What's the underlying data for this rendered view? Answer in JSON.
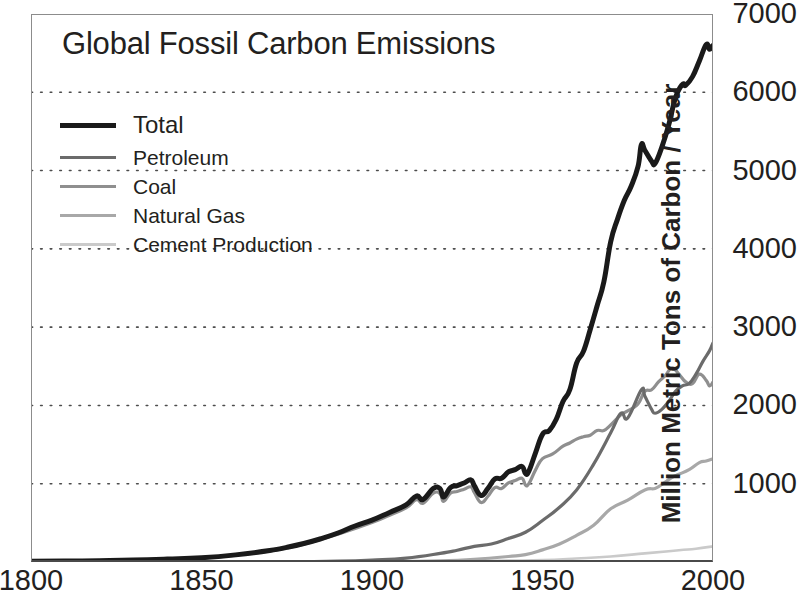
{
  "chart_data": {
    "type": "line",
    "title": "Global Fossil Carbon Emissions",
    "xlabel": "",
    "ylabel": "Million Metric Tons of Carbon / Year",
    "xlim": [
      1800,
      2000
    ],
    "ylim": [
      0,
      7000
    ],
    "xticks": [
      1800,
      1850,
      1900,
      1950,
      2000
    ],
    "xtick_labels": [
      "1800",
      "1850",
      "1900",
      "1950",
      "2000"
    ],
    "yticks": [
      0,
      1000,
      2000,
      3000,
      4000,
      5000,
      6000,
      7000
    ],
    "ytick_labels": [
      "0",
      "1000",
      "2000",
      "3000",
      "4000",
      "5000",
      "6000",
      "7000"
    ],
    "ytick_labels_shown": [
      "1000",
      "2000",
      "3000",
      "4000",
      "5000",
      "6000",
      "7000"
    ],
    "grid": "horizontal-dotted",
    "y_axis_position": "right",
    "legend_position": "upper-left-inside",
    "series": [
      {
        "name": "Total",
        "color": "#1a1a1a",
        "width": 5,
        "x": [
          1800,
          1810,
          1820,
          1830,
          1840,
          1850,
          1860,
          1870,
          1875,
          1880,
          1885,
          1890,
          1895,
          1900,
          1905,
          1910,
          1913,
          1915,
          1918,
          1920,
          1921,
          1923,
          1925,
          1927,
          1929,
          1930,
          1932,
          1934,
          1936,
          1938,
          1940,
          1942,
          1944,
          1945,
          1946,
          1948,
          1950,
          1952,
          1954,
          1956,
          1958,
          1960,
          1962,
          1964,
          1966,
          1968,
          1970,
          1972,
          1974,
          1976,
          1978,
          1979,
          1980,
          1982,
          1983,
          1985,
          1987,
          1989,
          1991,
          1992,
          1994,
          1996,
          1998,
          1999,
          2000
        ],
        "y": [
          8,
          12,
          17,
          24,
          37,
          54,
          91,
          147,
          187,
          236,
          297,
          370,
          460,
          534,
          630,
          730,
          843,
          800,
          940,
          935,
          830,
          950,
          975,
          1010,
          1050,
          975,
          850,
          940,
          1060,
          1070,
          1150,
          1180,
          1220,
          1130,
          1160,
          1400,
          1630,
          1680,
          1820,
          2050,
          2200,
          2540,
          2690,
          2970,
          3270,
          3580,
          4090,
          4380,
          4620,
          4800,
          5050,
          5330,
          5260,
          5120,
          5090,
          5300,
          5580,
          5930,
          6100,
          6090,
          6200,
          6400,
          6610,
          6550,
          6600
        ]
      },
      {
        "name": "Petroleum",
        "color": "#6b6b6b",
        "width": 3.2,
        "x": [
          1870,
          1880,
          1890,
          1900,
          1910,
          1920,
          1925,
          1930,
          1935,
          1940,
          1945,
          1950,
          1955,
          1960,
          1965,
          1970,
          1973,
          1975,
          1979,
          1980,
          1982,
          1983,
          1985,
          1987,
          1989,
          1991,
          1993,
          1995,
          1997,
          1999,
          2000
        ],
        "y": [
          1,
          4,
          10,
          25,
          50,
          110,
          150,
          200,
          230,
          300,
          380,
          530,
          700,
          920,
          1250,
          1650,
          1900,
          1840,
          2200,
          2120,
          1950,
          1900,
          1950,
          2050,
          2180,
          2250,
          2280,
          2400,
          2560,
          2700,
          2800
        ]
      },
      {
        "name": "Coal",
        "color": "#8f8f8f",
        "width": 3.2,
        "x": [
          1800,
          1820,
          1840,
          1850,
          1860,
          1870,
          1880,
          1890,
          1900,
          1905,
          1910,
          1913,
          1915,
          1918,
          1920,
          1921,
          1923,
          1925,
          1927,
          1929,
          1930,
          1932,
          1934,
          1936,
          1938,
          1940,
          1942,
          1944,
          1945,
          1946,
          1948,
          1950,
          1953,
          1956,
          1958,
          1960,
          1962,
          1964,
          1966,
          1968,
          1970,
          1973,
          1975,
          1978,
          1980,
          1982,
          1984,
          1986,
          1988,
          1990,
          1992,
          1994,
          1996,
          1998,
          1999,
          2000
        ],
        "y": [
          8,
          17,
          36,
          52,
          88,
          142,
          228,
          355,
          505,
          595,
          690,
          795,
          750,
          880,
          870,
          775,
          880,
          900,
          930,
          960,
          890,
          760,
          840,
          950,
          940,
          1010,
          1040,
          1070,
          985,
          1000,
          1180,
          1320,
          1380,
          1480,
          1520,
          1570,
          1600,
          1620,
          1680,
          1680,
          1750,
          1880,
          1930,
          2020,
          2180,
          2200,
          2300,
          2380,
          2480,
          2400,
          2300,
          2280,
          2400,
          2320,
          2250,
          2300
        ]
      },
      {
        "name": "Natural Gas",
        "color": "#a8a8a8",
        "width": 3.2,
        "x": [
          1885,
          1900,
          1910,
          1920,
          1930,
          1940,
          1945,
          1950,
          1955,
          1960,
          1965,
          1970,
          1975,
          1980,
          1983,
          1985,
          1988,
          1990,
          1993,
          1996,
          1998,
          2000
        ],
        "y": [
          1,
          3,
          8,
          15,
          35,
          70,
          95,
          155,
          230,
          340,
          470,
          680,
          790,
          920,
          940,
          990,
          1080,
          1120,
          1180,
          1270,
          1290,
          1320
        ]
      },
      {
        "name": "Cement Production",
        "color": "#cacaca",
        "width": 2.6,
        "x": [
          1928,
          1940,
          1950,
          1960,
          1970,
          1980,
          1990,
          1995,
          2000
        ],
        "y": [
          10,
          18,
          25,
          45,
          70,
          110,
          150,
          170,
          200
        ]
      }
    ]
  },
  "legend": {
    "items": [
      {
        "label": "Total"
      },
      {
        "label": "Petroleum"
      },
      {
        "label": "Coal"
      },
      {
        "label": "Natural Gas"
      },
      {
        "label": "Cement Production"
      }
    ]
  }
}
